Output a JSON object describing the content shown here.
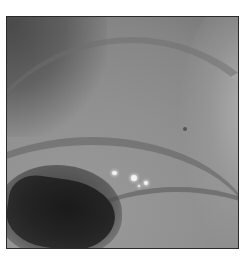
{
  "image": {
    "description": "Grayscale endoscopic view of a tubular lumen with circumferential mucosal folds",
    "colors": {
      "background": "#ffffff",
      "border": "#2a2a2a",
      "mucosa": "#8c8c8c",
      "lumen": "#1a1a1a",
      "specular": "#f2f2f2"
    },
    "features": [
      {
        "name": "lumen",
        "position": "lower-left",
        "tone": "dark"
      },
      {
        "name": "specular-highlights",
        "position": "center-lower",
        "count": 4
      },
      {
        "name": "circumferential-folds",
        "position": "throughout"
      }
    ]
  }
}
